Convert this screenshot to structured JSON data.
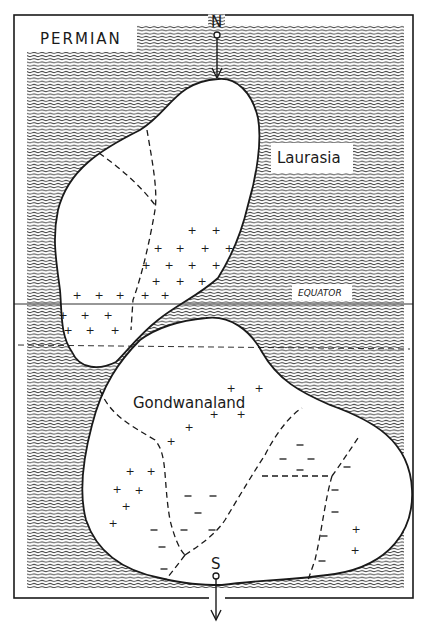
{
  "map": {
    "title": "PERMIAN",
    "north_label": "N",
    "south_label": "S",
    "equator_label": "EQUATOR",
    "continents": [
      {
        "name": "Laurasia",
        "label": "Laurasia"
      },
      {
        "name": "Gondwanaland",
        "label": "Gondwanaland"
      }
    ],
    "symbols": {
      "plus": "+",
      "minus": "–"
    },
    "colors": {
      "ink": "#1a1a1a",
      "ocean_hatch": "#3a3a3a",
      "land": "#ffffff",
      "paper": "#ffffff"
    }
  }
}
